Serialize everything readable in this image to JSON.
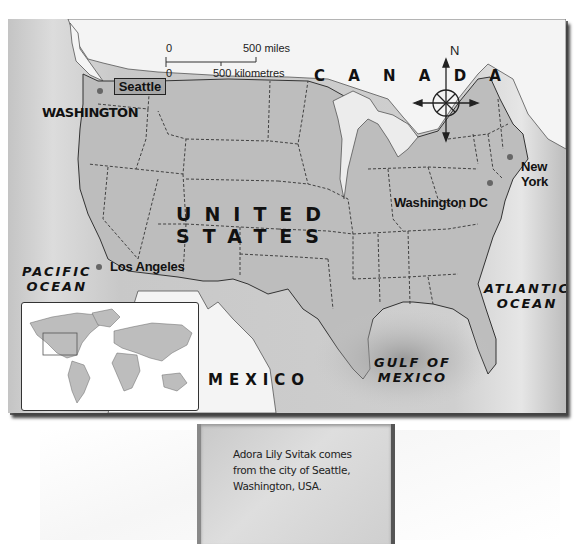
{
  "map": {
    "title_region": "United States map",
    "labels": {
      "canada": "C A N A D A",
      "us_line1": "UNITED",
      "us_line2": "STATES",
      "mexico": "MEXICO",
      "pacific_line1": "PACIFIC",
      "pacific_line2": "OCEAN",
      "atlantic_line1": "ATLANTIC",
      "atlantic_line2": "OCEAN",
      "gulf_line1": "GULF OF",
      "gulf_line2": "MEXICO",
      "washington_state": "WASHINGTON"
    },
    "cities": [
      {
        "name": "Seattle",
        "highlighted": true
      },
      {
        "name": "Los Angeles",
        "highlighted": false
      },
      {
        "name": "Washington DC",
        "highlighted": false
      },
      {
        "name": "New York",
        "name_line1": "New",
        "name_line2": "York",
        "highlighted": false
      }
    ],
    "scale": {
      "miles_zero": "0",
      "miles_label": "500 miles",
      "km_zero": "0",
      "km_label": "500 kilometres"
    },
    "compass": {
      "north_label": "N",
      "icon": "compass-rose-icon"
    },
    "inset": {
      "description": "World map with North America highlighted",
      "icon": "world-map-icon"
    },
    "colors": {
      "land_us": "#bdbdbd",
      "land_foreign": "#f2f2f2",
      "water": "#c8c8c8",
      "border": "#333333"
    }
  },
  "caption": {
    "text_line1": "Adora Lily Svitak comes",
    "text_line2": "from the city of Seattle,",
    "text_line3": "Washington, USA."
  }
}
